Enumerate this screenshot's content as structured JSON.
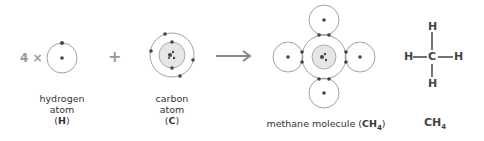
{
  "reactants": {
    "hydrogen": {
      "multiplier": "4 ×",
      "label_line1": "hydrogen",
      "label_line2": "atom",
      "symbol_open": "(",
      "symbol": "H",
      "symbol_close": ")"
    },
    "plus": "+",
    "carbon": {
      "label_line1": "carbon",
      "label_line2": "atom",
      "symbol_open": "(",
      "symbol": "C",
      "symbol_close": ")"
    }
  },
  "arrow": "reaction-arrow",
  "product": {
    "label_prefix": "methane molecule (",
    "formula_main": "CH",
    "formula_sub": "4",
    "label_suffix": ")"
  },
  "structural_formula": {
    "center": "C",
    "top": "H",
    "bottom": "H",
    "left": "H",
    "right": "H",
    "bond_h": "—",
    "formula_main": "CH",
    "formula_sub": "4"
  },
  "colors": {
    "line": "#777777",
    "electron": "#444444",
    "nucleus_fill": "#e6e6e6",
    "operator": "#999999",
    "text": "#333333"
  }
}
